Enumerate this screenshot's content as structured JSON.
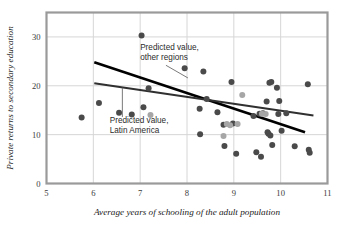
{
  "chart_data": {
    "type": "scatter",
    "title": "",
    "xlabel": "Average years of schooling of the adult population",
    "ylabel": "Private returns to secondary education",
    "xlim": [
      5,
      11
    ],
    "ylim": [
      0,
      35
    ],
    "xticks": [
      5,
      6,
      7,
      8,
      9,
      10,
      11
    ],
    "yticks": [
      0,
      10,
      20,
      30
    ],
    "grid": true,
    "legend_position": "none",
    "colors": {
      "other_regions_point": "#4a4a4a",
      "latin_america_point": "#a6a6a6",
      "other_regions_line": "#000000",
      "latin_america_line": "#3c3c3c",
      "frame": "#9a9a9a",
      "gridline": "#d6d6d6"
    },
    "series": [
      {
        "name": "Other regions",
        "marker": "circle",
        "color": "#4a4a4a",
        "points": [
          [
            5.75,
            13.5
          ],
          [
            6.12,
            16.5
          ],
          [
            6.55,
            14.5
          ],
          [
            6.82,
            14.1
          ],
          [
            7.03,
            30.3
          ],
          [
            7.07,
            15.6
          ],
          [
            7.18,
            19.5
          ],
          [
            7.95,
            23.6
          ],
          [
            8.27,
            15.3
          ],
          [
            8.28,
            10.1
          ],
          [
            8.35,
            22.9
          ],
          [
            8.42,
            17.3
          ],
          [
            8.65,
            14.6
          ],
          [
            8.78,
            12.0
          ],
          [
            8.8,
            7.7
          ],
          [
            8.98,
            12.3
          ],
          [
            9.05,
            6.1
          ],
          [
            8.95,
            20.8
          ],
          [
            9.42,
            13.8
          ],
          [
            9.48,
            6.4
          ],
          [
            9.55,
            14.3
          ],
          [
            9.62,
            14.4
          ],
          [
            9.58,
            5.5
          ],
          [
            9.7,
            16.8
          ],
          [
            9.72,
            10.5
          ],
          [
            9.74,
            10.2
          ],
          [
            9.76,
            20.6
          ],
          [
            9.8,
            20.8
          ],
          [
            9.78,
            9.8
          ],
          [
            9.82,
            7.9
          ],
          [
            9.92,
            19.6
          ],
          [
            9.95,
            14.2
          ],
          [
            9.97,
            16.9
          ],
          [
            10.02,
            10.8
          ],
          [
            10.12,
            14.4
          ],
          [
            10.3,
            7.6
          ],
          [
            10.58,
            20.3
          ],
          [
            10.6,
            6.9
          ],
          [
            10.62,
            6.3
          ]
        ]
      },
      {
        "name": "Latin America",
        "marker": "circle",
        "color": "#a6a6a6",
        "points": [
          [
            7.22,
            14.0
          ],
          [
            8.78,
            9.7
          ],
          [
            9.08,
            12.2
          ],
          [
            9.18,
            18.1
          ],
          [
            8.85,
            12.2
          ],
          [
            9.6,
            14.3
          ],
          [
            9.68,
            14.2
          ],
          [
            8.92,
            11.9
          ]
        ]
      }
    ],
    "trendlines": [
      {
        "name": "Predicted value, other regions",
        "color": "#000000",
        "width": 2.6,
        "from": [
          6.02,
          24.8
        ],
        "to": [
          10.52,
          10.5
        ]
      },
      {
        "name": "Predicted value, Latin America",
        "color": "#303030",
        "width": 2.0,
        "from": [
          6.02,
          20.5
        ],
        "to": [
          10.7,
          13.9
        ]
      }
    ],
    "annotations": [
      {
        "id": "annot-other-regions",
        "lines": [
          "Predicted value,",
          "other regions"
        ],
        "text_x": 7.0,
        "text_y": 27.4,
        "leader_from": [
          7.55,
          24.2
        ],
        "leader_to": [
          8.02,
          21.6
        ]
      },
      {
        "id": "annot-latin-america",
        "lines": [
          "Predicted value,",
          "Latin America"
        ],
        "text_x": 6.35,
        "text_y": 12.3,
        "leader_from": [
          6.62,
          13.6
        ],
        "leader_to": [
          6.62,
          19.6
        ]
      }
    ]
  }
}
